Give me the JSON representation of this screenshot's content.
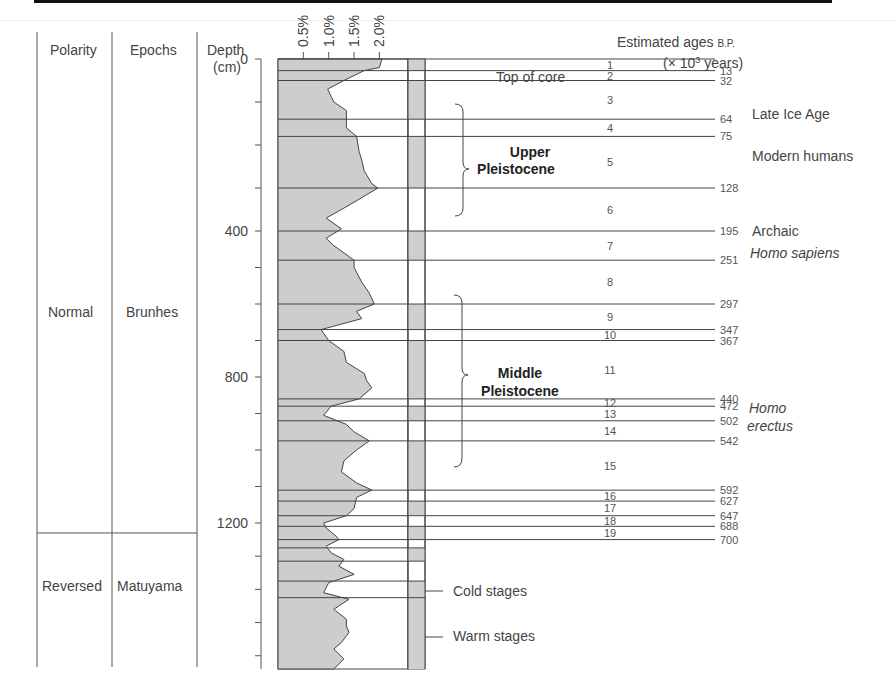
{
  "headers": {
    "polarity": "Polarity",
    "epochs": "Epochs",
    "depth_line1": "Depth",
    "depth_line2": "(cm)",
    "ages_line1": "Estimated ages",
    "ages_bp": "B.P.",
    "ages_line2_pre": "(× 10",
    "ages_line2_sup": "3",
    "ages_line2_post": " years)",
    "top_of_core": "Top of core"
  },
  "polarity": [
    {
      "label": "Normal",
      "epoch": "Brunhes"
    },
    {
      "label": "Reversed",
      "epoch": "Matuyama"
    }
  ],
  "depth_ticks": [
    "0",
    "400",
    "800",
    "1200"
  ],
  "percent_ticks": [
    "0.5%",
    "1.0%",
    "1.5%",
    "2.0%"
  ],
  "periods": [
    {
      "line1": "Upper",
      "line2": "Pleistocene"
    },
    {
      "line1": "Middle",
      "line2": "Pleistocene"
    }
  ],
  "hominins": [
    {
      "text": "Late Ice Age",
      "italic": false
    },
    {
      "text": "Modern humans",
      "italic": false
    },
    {
      "text": "Archaic",
      "italic": false
    },
    {
      "text": "Homo sapiens",
      "italic": true
    },
    {
      "text": "Homo",
      "italic": true
    },
    {
      "text": "erectus",
      "italic": true
    }
  ],
  "legend": {
    "cold": "Cold stages",
    "warm": "Warm stages"
  },
  "chart_data": {
    "type": "area",
    "title": "",
    "xlabel": "Carbonate content (%)",
    "ylabel": "Depth (cm)",
    "x_ticks": [
      "0.5%",
      "1.0%",
      "1.5%",
      "2.0%"
    ],
    "y_ticks": [
      0,
      400,
      800,
      1200
    ],
    "ylim": [
      0,
      1640
    ],
    "xlim": [
      0,
      2.5
    ],
    "curve": [
      [
        0,
        2.05
      ],
      [
        20,
        2.0
      ],
      [
        27,
        1.7
      ],
      [
        50,
        1.3
      ],
      [
        70,
        0.98
      ],
      [
        100,
        1.1
      ],
      [
        120,
        1.35
      ],
      [
        160,
        1.35
      ],
      [
        180,
        1.55
      ],
      [
        215,
        1.6
      ],
      [
        235,
        1.65
      ],
      [
        260,
        1.7
      ],
      [
        290,
        1.85
      ],
      [
        300,
        1.97
      ],
      [
        340,
        1.4
      ],
      [
        370,
        0.95
      ],
      [
        395,
        1.25
      ],
      [
        420,
        0.95
      ],
      [
        440,
        1.1
      ],
      [
        480,
        1.5
      ],
      [
        500,
        1.5
      ],
      [
        540,
        1.65
      ],
      [
        570,
        1.8
      ],
      [
        600,
        1.9
      ],
      [
        620,
        1.55
      ],
      [
        640,
        1.65
      ],
      [
        670,
        0.85
      ],
      [
        700,
        1.0
      ],
      [
        730,
        1.3
      ],
      [
        760,
        1.35
      ],
      [
        790,
        1.7
      ],
      [
        810,
        1.75
      ],
      [
        830,
        1.85
      ],
      [
        860,
        1.6
      ],
      [
        880,
        1.05
      ],
      [
        905,
        0.9
      ],
      [
        930,
        1.35
      ],
      [
        950,
        1.5
      ],
      [
        975,
        1.8
      ],
      [
        1000,
        1.55
      ],
      [
        1030,
        1.3
      ],
      [
        1060,
        1.25
      ],
      [
        1090,
        1.55
      ],
      [
        1110,
        1.85
      ],
      [
        1130,
        1.55
      ],
      [
        1160,
        1.5
      ],
      [
        1180,
        1.35
      ],
      [
        1200,
        0.9
      ],
      [
        1215,
        0.95
      ],
      [
        1240,
        1.15
      ],
      [
        1250,
        1.2
      ],
      [
        1270,
        0.95
      ],
      [
        1290,
        1.05
      ],
      [
        1310,
        1.3
      ],
      [
        1330,
        1.2
      ],
      [
        1355,
        1.5
      ],
      [
        1380,
        1.0
      ],
      [
        1410,
        0.9
      ],
      [
        1430,
        1.4
      ],
      [
        1450,
        1.2
      ],
      [
        1460,
        1.1
      ],
      [
        1490,
        1.35
      ],
      [
        1510,
        1.35
      ],
      [
        1530,
        1.4
      ],
      [
        1560,
        1.25
      ],
      [
        1580,
        1.1
      ],
      [
        1610,
        1.3
      ],
      [
        1640,
        1.1
      ]
    ],
    "stages": [
      {
        "stage": "1",
        "top": 0,
        "bottom": 27,
        "age_bottom": "13",
        "type": "warm"
      },
      {
        "stage": "2",
        "top": 27,
        "bottom": 50,
        "age_bottom": "32",
        "type": "cold"
      },
      {
        "stage": "3",
        "top": 50,
        "bottom": 140,
        "age_bottom": "64",
        "type": "warm"
      },
      {
        "stage": "4",
        "top": 140,
        "bottom": 180,
        "age_bottom": "75",
        "type": "cold"
      },
      {
        "stage": "5",
        "top": 180,
        "bottom": 300,
        "age_bottom": "128",
        "type": "warm"
      },
      {
        "stage": "6",
        "top": 300,
        "bottom": 400,
        "age_bottom": "195",
        "type": "cold"
      },
      {
        "stage": "7",
        "top": 400,
        "bottom": 480,
        "age_bottom": "251",
        "type": "warm"
      },
      {
        "stage": "8",
        "top": 480,
        "bottom": 600,
        "age_bottom": "297",
        "type": "cold"
      },
      {
        "stage": "9",
        "top": 600,
        "bottom": 670,
        "age_bottom": "347",
        "type": "warm"
      },
      {
        "stage": "10",
        "top": 670,
        "bottom": 700,
        "age_bottom": "367",
        "type": "cold"
      },
      {
        "stage": "11",
        "top": 700,
        "bottom": 860,
        "age_bottom": "440",
        "type": "warm"
      },
      {
        "stage": "12",
        "top": 860,
        "bottom": 880,
        "age_bottom": "472",
        "type": "cold"
      },
      {
        "stage": "13",
        "top": 880,
        "bottom": 920,
        "age_bottom": "502",
        "type": "warm"
      },
      {
        "stage": "14",
        "top": 920,
        "bottom": 975,
        "age_bottom": "542",
        "type": "cold"
      },
      {
        "stage": "15",
        "top": 975,
        "bottom": 1110,
        "age_bottom": "592",
        "type": "warm"
      },
      {
        "stage": "16",
        "top": 1110,
        "bottom": 1140,
        "age_bottom": "627",
        "type": "cold"
      },
      {
        "stage": "17",
        "top": 1140,
        "bottom": 1180,
        "age_bottom": "647",
        "type": "warm"
      },
      {
        "stage": "18",
        "top": 1180,
        "bottom": 1210,
        "age_bottom": "688",
        "type": "cold"
      },
      {
        "stage": "19",
        "top": 1210,
        "bottom": 1250,
        "age_bottom": "700",
        "type": "warm"
      }
    ],
    "extra_boundaries": [
      1275,
      1315,
      1375,
      1425
    ],
    "polarity_boundary_depth": 1230,
    "legend": [
      {
        "label": "Cold stages",
        "fill": "#ffffff"
      },
      {
        "label": "Warm stages",
        "fill": "#cfcfcf"
      }
    ],
    "colors": {
      "fill": "#cdcdcd",
      "line": "#444444"
    }
  }
}
